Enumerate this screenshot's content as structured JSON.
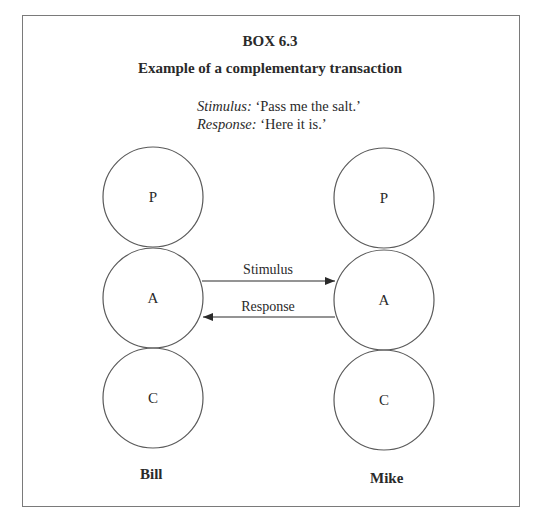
{
  "box": {
    "number": "BOX 6.3",
    "title": "Example of a complementary transaction"
  },
  "dialogue": {
    "stimulus_tag": "Stimulus:",
    "stimulus_text": " ‘Pass me the salt.’",
    "response_tag": "Response:",
    "response_text": " ‘Here it is.’"
  },
  "diagram": {
    "left_person": {
      "name": "Bill",
      "states": [
        {
          "label": "P",
          "cx": 153,
          "cy": 197,
          "r": 50
        },
        {
          "label": "A",
          "cx": 153,
          "cy": 298,
          "r": 50
        },
        {
          "label": "C",
          "cx": 153,
          "cy": 398,
          "r": 50
        }
      ]
    },
    "right_person": {
      "name": "Mike",
      "states": [
        {
          "label": "P",
          "cx": 384,
          "cy": 198,
          "r": 50
        },
        {
          "label": "A",
          "cx": 384,
          "cy": 300,
          "r": 50
        },
        {
          "label": "C",
          "cx": 384,
          "cy": 400,
          "r": 50
        }
      ]
    },
    "arrows": [
      {
        "label": "Stimulus",
        "from": "Bill.A",
        "to": "Mike.A",
        "y": 281
      },
      {
        "label": "Response",
        "from": "Mike.A",
        "to": "Bill.A",
        "y": 317
      }
    ]
  },
  "colors": {
    "stroke": "#5a5a5a",
    "border": "#7a7a7a",
    "text": "#2a2a2a"
  }
}
